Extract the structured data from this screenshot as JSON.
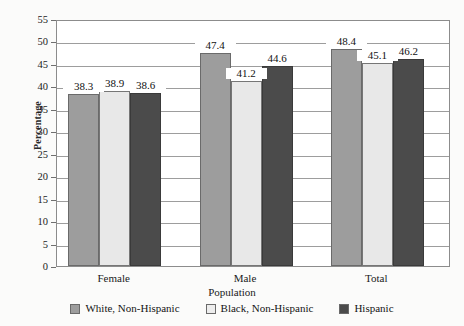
{
  "chart_data": {
    "type": "bar",
    "title": "",
    "xlabel": "Population",
    "ylabel": "Percentage",
    "categories": [
      "Female",
      "Male",
      "Total"
    ],
    "series": [
      {
        "name": "White, Non-Hispanic",
        "values": [
          38.3,
          47.4,
          48.4
        ],
        "color": "#9d9d9d"
      },
      {
        "name": "Black, Non-Hispanic",
        "values": [
          38.9,
          41.2,
          45.1
        ],
        "color": "#e8e8e8"
      },
      {
        "name": "Hispanic",
        "values": [
          38.6,
          44.6,
          46.2
        ],
        "color": "#4b4b4b"
      }
    ],
    "ylim": [
      0,
      55
    ],
    "ytick_step": 5,
    "ytick_labels": [
      "0",
      "5",
      "10",
      "15",
      "20",
      "25",
      "30",
      "35",
      "40",
      "45",
      "50",
      "55"
    ],
    "grid": true,
    "data_labels": true,
    "legend_position": "bottom"
  },
  "axis": {
    "y_title": "Percentage",
    "x_title": "Population"
  },
  "legend": {
    "items": [
      {
        "label": "White, Non-Hispanic"
      },
      {
        "label": "Black, Non-Hispanic"
      },
      {
        "label": "Hispanic"
      }
    ]
  }
}
